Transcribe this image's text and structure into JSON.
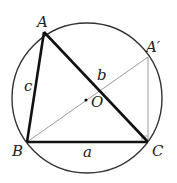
{
  "diagram": {
    "circle": {
      "cx": 87,
      "cy": 98,
      "r": 75,
      "stroke": "#333333"
    },
    "points": {
      "A": {
        "x": 44,
        "y": 32,
        "label": "A"
      },
      "B": {
        "x": 27,
        "y": 142,
        "label": "B"
      },
      "C": {
        "x": 148,
        "y": 142,
        "label": "C"
      },
      "A_prime": {
        "x": 148,
        "y": 57,
        "label": "A′"
      },
      "O": {
        "x": 86,
        "y": 100,
        "label": "O"
      }
    },
    "side_labels": {
      "a": "a",
      "b": "b",
      "c": "c"
    },
    "colors": {
      "triangle": "#111111",
      "construction": "#9a9a9a",
      "circle": "#333333"
    }
  }
}
